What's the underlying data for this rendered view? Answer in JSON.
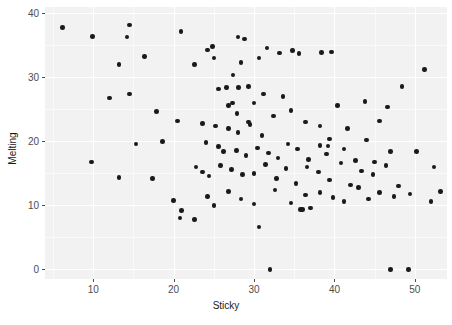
{
  "chart_data": {
    "type": "scatter",
    "title": "",
    "xlabel": "Sticky",
    "ylabel": "Melting",
    "xlim": [
      4.0,
      54.0
    ],
    "ylim": [
      -1.5,
      41.0
    ],
    "xticks": [
      10,
      20,
      30,
      40,
      50
    ],
    "yticks": [
      0,
      10,
      20,
      30,
      40
    ],
    "xtick_labels": [
      "10",
      "20",
      "30",
      "40",
      "50"
    ],
    "ytick_labels": [
      "0",
      "10",
      "20",
      "30",
      "40"
    ],
    "grid": true,
    "grid_color": "#ffffff",
    "panel_color": "#f2f2f2",
    "point_color": "#1a1a1a",
    "point_size": 4.6,
    "legend": null,
    "n_points": 117,
    "points": [
      [
        6.2,
        37.8
      ],
      [
        9.9,
        36.4
      ],
      [
        14.5,
        38.2
      ],
      [
        14.2,
        36.3
      ],
      [
        13.2,
        32.0
      ],
      [
        16.4,
        33.3
      ],
      [
        20.9,
        37.2
      ],
      [
        22.6,
        32.0
      ],
      [
        24.2,
        34.3
      ],
      [
        24.8,
        34.8
      ],
      [
        25.0,
        33.0
      ],
      [
        14.5,
        27.4
      ],
      [
        12.0,
        26.8
      ],
      [
        17.9,
        24.7
      ],
      [
        20.5,
        23.2
      ],
      [
        26.6,
        28.4
      ],
      [
        27.3,
        26.0
      ],
      [
        29.3,
        23.0
      ],
      [
        18.6,
        20.0
      ],
      [
        9.8,
        16.8
      ],
      [
        15.3,
        19.6
      ],
      [
        13.2,
        14.4
      ],
      [
        28.0,
        36.3
      ],
      [
        28.8,
        36.0
      ],
      [
        31.6,
        34.6
      ],
      [
        33.2,
        33.8
      ],
      [
        30.6,
        33.0
      ],
      [
        28.4,
        32.3
      ],
      [
        27.4,
        30.4
      ],
      [
        34.8,
        34.2
      ],
      [
        35.6,
        33.7
      ],
      [
        38.4,
        33.9
      ],
      [
        39.6,
        34.0
      ],
      [
        25.6,
        28.2
      ],
      [
        28.1,
        28.4
      ],
      [
        29.3,
        28.6
      ],
      [
        31.2,
        27.4
      ],
      [
        26.8,
        25.6
      ],
      [
        27.9,
        24.4
      ],
      [
        30.0,
        26.0
      ],
      [
        33.6,
        27.0
      ],
      [
        23.6,
        22.8
      ],
      [
        25.2,
        22.4
      ],
      [
        26.8,
        22.0
      ],
      [
        28.0,
        21.4
      ],
      [
        29.5,
        22.6
      ],
      [
        31.0,
        20.9
      ],
      [
        32.4,
        24.0
      ],
      [
        34.6,
        24.8
      ],
      [
        36.4,
        23.0
      ],
      [
        38.2,
        22.4
      ],
      [
        40.4,
        25.6
      ],
      [
        41.6,
        22.0
      ],
      [
        43.8,
        26.2
      ],
      [
        45.6,
        23.2
      ],
      [
        51.2,
        31.2
      ],
      [
        48.4,
        28.6
      ],
      [
        46.6,
        25.4
      ],
      [
        24.0,
        19.8
      ],
      [
        25.6,
        19.2
      ],
      [
        26.2,
        18.4
      ],
      [
        27.8,
        18.6
      ],
      [
        29.0,
        17.8
      ],
      [
        30.4,
        19.0
      ],
      [
        31.8,
        18.2
      ],
      [
        33.0,
        17.4
      ],
      [
        34.2,
        19.6
      ],
      [
        35.4,
        18.8
      ],
      [
        36.8,
        17.2
      ],
      [
        38.2,
        19.4
      ],
      [
        39.0,
        18.0
      ],
      [
        39.2,
        19.3
      ],
      [
        39.4,
        20.4
      ],
      [
        41.2,
        18.8
      ],
      [
        42.6,
        17.0
      ],
      [
        44.0,
        20.2
      ],
      [
        45.0,
        16.8
      ],
      [
        47.0,
        18.4
      ],
      [
        22.8,
        16.0
      ],
      [
        23.6,
        15.2
      ],
      [
        24.4,
        14.6
      ],
      [
        25.8,
        16.2
      ],
      [
        27.2,
        15.6
      ],
      [
        28.6,
        14.8
      ],
      [
        30.0,
        15.0
      ],
      [
        31.4,
        16.4
      ],
      [
        32.8,
        14.2
      ],
      [
        34.0,
        15.8
      ],
      [
        35.2,
        13.4
      ],
      [
        36.6,
        16.0
      ],
      [
        38.0,
        15.2
      ],
      [
        39.4,
        14.0
      ],
      [
        40.8,
        16.6
      ],
      [
        42.0,
        13.2
      ],
      [
        43.4,
        15.4
      ],
      [
        44.8,
        14.8
      ],
      [
        46.4,
        16.2
      ],
      [
        48.0,
        13.0
      ],
      [
        50.2,
        18.4
      ],
      [
        52.4,
        16.0
      ],
      [
        53.2,
        12.2
      ],
      [
        20.0,
        10.8
      ],
      [
        21.0,
        9.2
      ],
      [
        20.8,
        8.0
      ],
      [
        24.2,
        11.4
      ],
      [
        25.0,
        10.0
      ],
      [
        26.8,
        12.2
      ],
      [
        28.4,
        11.0
      ],
      [
        30.0,
        10.2
      ],
      [
        32.6,
        12.4
      ],
      [
        34.6,
        10.4
      ],
      [
        35.8,
        9.4
      ],
      [
        36.0,
        9.4
      ],
      [
        37.0,
        9.6
      ],
      [
        36.4,
        11.6
      ],
      [
        38.2,
        12.0
      ],
      [
        39.8,
        11.2
      ],
      [
        41.2,
        10.6
      ],
      [
        43.0,
        12.8
      ],
      [
        44.2,
        11.0
      ],
      [
        45.6,
        12.0
      ],
      [
        47.4,
        11.4
      ],
      [
        49.4,
        11.8
      ],
      [
        52.0,
        10.6
      ],
      [
        17.4,
        14.2
      ],
      [
        22.6,
        7.8
      ],
      [
        30.6,
        6.6
      ],
      [
        32.0,
        0.0
      ],
      [
        47.0,
        0.0
      ],
      [
        49.2,
        0.0
      ]
    ]
  }
}
